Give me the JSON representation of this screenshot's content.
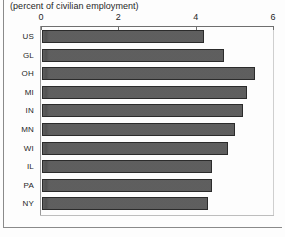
{
  "chart_data": {
    "type": "bar",
    "orientation": "horizontal",
    "title": "",
    "subtitle": "(percent of civilian employment)",
    "xlabel": "",
    "ylabel": "",
    "xlim": [
      0,
      6
    ],
    "xticks": [
      0,
      2,
      4,
      6
    ],
    "xtick_labels": [
      "0",
      "2",
      "4",
      "6"
    ],
    "grid": false,
    "legend": "none",
    "categories": [
      "US",
      "GL",
      "OH",
      "MI",
      "IN",
      "MN",
      "WI",
      "IL",
      "PA",
      "NY"
    ],
    "values": [
      4.2,
      4.7,
      5.5,
      5.3,
      5.2,
      5.0,
      4.8,
      4.4,
      4.4,
      4.3
    ],
    "bars": [
      {
        "label": "US",
        "value": 4.2
      },
      {
        "label": "GL",
        "value": 4.7
      },
      {
        "label": "OH",
        "value": 5.5
      },
      {
        "label": "MI",
        "value": 5.3
      },
      {
        "label": "IN",
        "value": 5.2
      },
      {
        "label": "MN",
        "value": 5.0
      },
      {
        "label": "WI",
        "value": 4.8
      },
      {
        "label": "IL",
        "value": 4.4
      },
      {
        "label": "PA",
        "value": 4.4
      },
      {
        "label": "NY",
        "value": 4.3
      }
    ],
    "colors": {
      "bar_fill": "#565656",
      "bar_edge": "#2b2b2b",
      "axis": "#6f6f6f",
      "text": "#1f1f1f"
    }
  }
}
